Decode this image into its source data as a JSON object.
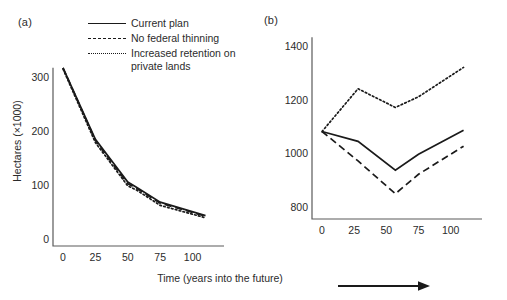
{
  "figure": {
    "panel_a_tag": "(a)",
    "panel_b_tag": "(b)",
    "shared_xlabel": "Time (years into the future)",
    "arrow_icon": "right-arrow-icon",
    "line_color": "#1a1a1a",
    "background_color": "#ffffff"
  },
  "legend": {
    "position": "top-left-inside-panel-a",
    "entries": [
      {
        "label": "Current plan",
        "style": "solid",
        "swatch": "solid-line-swatch"
      },
      {
        "label": "No federal thinning",
        "style": "dashed",
        "swatch": "dashed-line-swatch"
      },
      {
        "label": "Increased retention on private lands",
        "style": "dotted",
        "swatch": "dotted-line-swatch"
      }
    ]
  },
  "chart_data": [
    {
      "type": "line",
      "panel": "(a)",
      "title": "",
      "xlabel": "Time (years into the future)",
      "ylabel": "Hectares (×1000)",
      "xlim": [
        0,
        115
      ],
      "ylim": [
        0,
        340
      ],
      "xticks": [
        0,
        25,
        50,
        75,
        100
      ],
      "xtick_labels": [
        "0",
        "25",
        "50",
        "75",
        "100"
      ],
      "yticks": [
        0,
        100,
        200,
        300
      ],
      "ytick_labels": [
        "0",
        "100",
        "200",
        "300"
      ],
      "grid": false,
      "x": [
        0,
        25,
        50,
        57,
        75,
        110
      ],
      "series": [
        {
          "name": "Current plan",
          "style": "solid",
          "values": [
            318,
            186,
            107,
            97,
            70,
            45
          ]
        },
        {
          "name": "No federal thinning",
          "style": "dashed",
          "values": [
            318,
            184,
            104,
            95,
            68,
            44
          ]
        },
        {
          "name": "Increased retention on private lands",
          "style": "dotted",
          "values": [
            316,
            180,
            100,
            92,
            64,
            41
          ]
        }
      ]
    },
    {
      "type": "line",
      "panel": "(b)",
      "title": "",
      "xlabel": "Time (years into the future)",
      "ylabel": "",
      "xlim": [
        0,
        115
      ],
      "ylim": [
        780,
        1420
      ],
      "xticks": [
        0,
        25,
        50,
        75,
        100
      ],
      "xtick_labels": [
        "0",
        "25",
        "50",
        "75",
        "100"
      ],
      "yticks": [
        800,
        1000,
        1200,
        1400
      ],
      "ytick_labels": [
        "800",
        "1000",
        "1200",
        "1400"
      ],
      "grid": false,
      "x": [
        0,
        28,
        57,
        75,
        110
      ],
      "series": [
        {
          "name": "Current plan",
          "style": "solid",
          "values": [
            1085,
            1048,
            940,
            1000,
            1090
          ]
        },
        {
          "name": "No federal thinning",
          "style": "dashed",
          "values": [
            1085,
            975,
            852,
            925,
            1030
          ]
        },
        {
          "name": "Increased retention on private lands",
          "style": "dotted",
          "values": [
            1085,
            1245,
            1175,
            1215,
            1325
          ]
        }
      ]
    }
  ]
}
